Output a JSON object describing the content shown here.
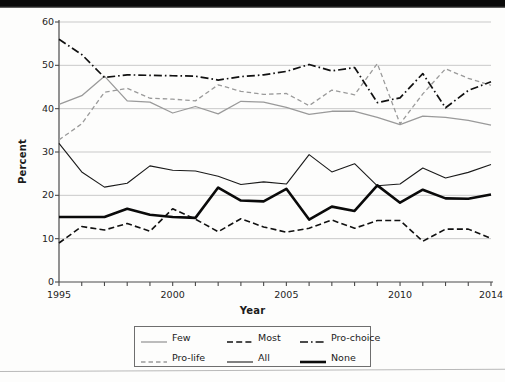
{
  "figure": {
    "kind": "line-chart-scan",
    "background": "#fdfdfc"
  },
  "axes": {
    "ylabel": "Percent",
    "xlabel": "Year",
    "y_ticks": [
      "0",
      "10",
      "20",
      "30",
      "40",
      "50",
      "60"
    ],
    "x_ticks": [
      "1995",
      "2000",
      "2005",
      "2010",
      "2014"
    ]
  },
  "legend": {
    "items": [
      {
        "label": "Few",
        "style": "solid",
        "color": "#9a9a9a",
        "width": 1.3
      },
      {
        "label": "Most",
        "style": "dashed",
        "color": "#111111",
        "width": 1.6
      },
      {
        "label": "Pro-choice",
        "style": "dashdot",
        "color": "#111111",
        "width": 1.7
      },
      {
        "label": "Pro-life",
        "style": "dashed",
        "color": "#9a9a9a",
        "width": 1.3
      },
      {
        "label": "All",
        "style": "solid",
        "color": "#1a1a1a",
        "width": 1.1
      },
      {
        "label": "None",
        "style": "solid",
        "color": "#0a0a0a",
        "width": 2.6
      }
    ]
  },
  "chart_data": {
    "type": "line",
    "title": "",
    "xlabel": "Year",
    "ylabel": "Percent",
    "xlim": [
      1995,
      2014
    ],
    "ylim": [
      0,
      60
    ],
    "ytick_values": [
      0,
      10,
      20,
      30,
      40,
      50,
      60
    ],
    "xtick_values": [
      1995,
      2000,
      2005,
      2010,
      2014
    ],
    "grid": "horizontal",
    "legend_position": "below-axes",
    "x": [
      1995,
      1996,
      1997,
      1998,
      1999,
      2000,
      2001,
      2002,
      2003,
      2004,
      2005,
      2006,
      2007,
      2008,
      2009,
      2010,
      2011,
      2012,
      2013,
      2014
    ],
    "series": [
      {
        "name": "Few",
        "style": "solid",
        "color": "#9a9a9a",
        "width": 1.3,
        "values": [
          41.0,
          43.0,
          47.5,
          41.8,
          41.5,
          39.0,
          40.5,
          38.8,
          41.7,
          41.5,
          40.3,
          38.7,
          39.4,
          39.4,
          38.0,
          36.3,
          38.3,
          38.0,
          37.3,
          36.2
        ]
      },
      {
        "name": "Pro-life",
        "style": "dashed",
        "color": "#9a9a9a",
        "width": 1.3,
        "values": [
          32.8,
          36.5,
          43.8,
          44.7,
          42.4,
          42.2,
          41.8,
          45.5,
          44.0,
          43.3,
          43.5,
          40.7,
          44.3,
          43.2,
          50.4,
          36.5,
          43.4,
          49.2,
          47.0,
          45.4
        ]
      },
      {
        "name": "Pro-choice",
        "style": "dashdot",
        "color": "#111111",
        "width": 1.7,
        "values": [
          56.0,
          52.5,
          47.2,
          47.8,
          47.7,
          47.6,
          47.5,
          46.6,
          47.4,
          47.8,
          48.6,
          50.2,
          48.7,
          49.5,
          41.4,
          42.5,
          48.1,
          40.2,
          44.2,
          46.2
        ]
      },
      {
        "name": "All",
        "style": "solid",
        "color": "#1a1a1a",
        "width": 1.1,
        "values": [
          32.0,
          25.4,
          21.9,
          22.8,
          26.8,
          25.8,
          25.6,
          24.4,
          22.5,
          23.1,
          22.6,
          29.4,
          25.4,
          27.3,
          22.2,
          22.6,
          26.3,
          24.0,
          25.3,
          27.1
        ]
      },
      {
        "name": "Most",
        "style": "dashed",
        "color": "#111111",
        "width": 1.6,
        "values": [
          9.0,
          12.8,
          12.0,
          13.5,
          11.7,
          16.9,
          14.5,
          11.6,
          14.6,
          12.7,
          11.5,
          12.4,
          14.3,
          12.4,
          14.2,
          14.2,
          9.4,
          12.2,
          12.2,
          10.1
        ]
      },
      {
        "name": "None",
        "style": "solid",
        "color": "#0a0a0a",
        "width": 2.6,
        "values": [
          15.0,
          15.0,
          15.0,
          16.9,
          15.5,
          15.0,
          14.8,
          21.8,
          18.8,
          18.6,
          21.5,
          14.4,
          17.4,
          16.4,
          22.3,
          18.3,
          21.3,
          19.3,
          19.2,
          20.2
        ]
      }
    ]
  }
}
